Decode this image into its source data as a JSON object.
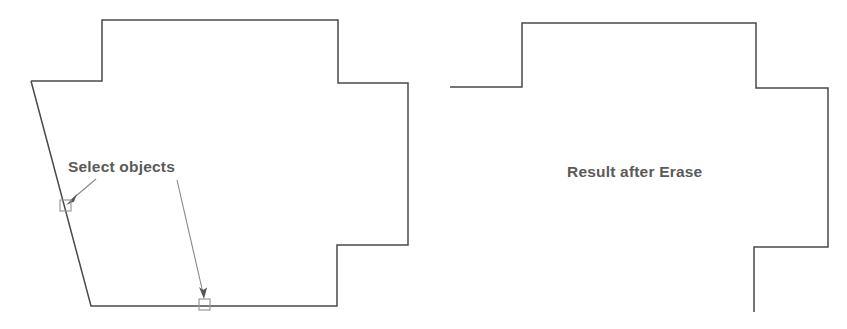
{
  "figure": {
    "background_color": "#ffffff",
    "line_color": "#4a4a4a",
    "leader_color": "#888888",
    "text_color": "#5a5a5a",
    "pickbox_color": "#9a9a9a",
    "width": 847,
    "height": 329
  },
  "left_panel": {
    "caption": "Select objects",
    "caption_position": {
      "x": 68,
      "y": 172
    },
    "shape_name": "original-outline",
    "shape_points": "31,81 102,81 102,20 338,20 338,83 408,83 408,245 337,245 337,306 91,306 31,81",
    "pick_boxes": [
      {
        "name": "pickbox-left-diagonal-edge",
        "x": 60,
        "y": 200,
        "size": 11
      },
      {
        "name": "pickbox-bottom-edge",
        "x": 199,
        "y": 299,
        "size": 11
      }
    ],
    "leaders": [
      {
        "name": "leader-to-diagonal-edge",
        "from": {
          "x": 96,
          "y": 179
        },
        "to": {
          "x": 68,
          "y": 202
        }
      },
      {
        "name": "leader-to-bottom-edge",
        "from": {
          "x": 177,
          "y": 180
        },
        "to": {
          "x": 204,
          "y": 296
        }
      }
    ]
  },
  "right_panel": {
    "caption": "Result after Erase",
    "caption_position": {
      "x": 567,
      "y": 177
    },
    "shape_name": "result-outline",
    "shape_points": "450,87 522,87 522,23 756,23 756,88 828,88 828,247 754,247 754,312"
  }
}
